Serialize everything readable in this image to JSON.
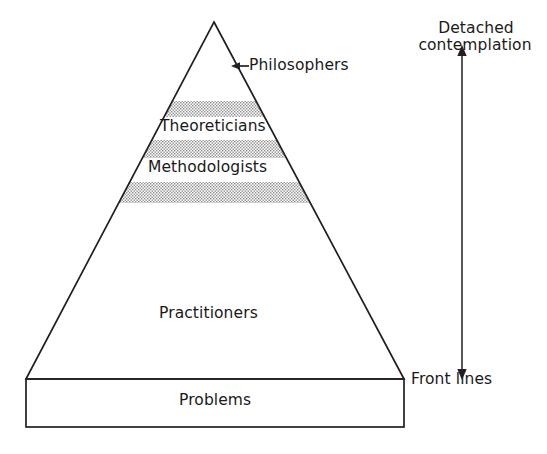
{
  "diagram": {
    "title_visible": false,
    "shape": "pyramid-hierarchy",
    "stroke_color": "#231f20",
    "band_fill": "#b9b9b9",
    "background": "#ffffff",
    "pyramid": {
      "apex": {
        "x": 214,
        "y": 22
      },
      "base_left": {
        "x": 26,
        "y": 379
      },
      "base_right": {
        "x": 404,
        "y": 379
      }
    },
    "layers": [
      {
        "key": "philosophers",
        "label": "Philosophers",
        "shaded": false,
        "callout": true
      },
      {
        "key": "theoreticians",
        "label": "Theoreticians",
        "shaded": true,
        "callout": false
      },
      {
        "key": "methodologists",
        "label": "Methodologists",
        "shaded": true,
        "callout": false
      },
      {
        "key": "practitioners",
        "label": "Practitioners",
        "shaded": false,
        "callout": false
      }
    ],
    "base_box": {
      "label": "Problems",
      "x": 26,
      "y": 379,
      "width": 378,
      "height": 48
    },
    "shaded_bands": [
      {
        "top": 101,
        "bottom": 117
      },
      {
        "top": 140,
        "bottom": 158
      },
      {
        "top": 182,
        "bottom": 203
      }
    ],
    "axis": {
      "shaft_x": 462,
      "top_y": 48,
      "bottom_y": 378,
      "top_label_line1": "Detached",
      "top_label_line2": "contemplation",
      "bottom_label": "Front lines",
      "double_headed": true
    },
    "callout": {
      "label": "Philosophers",
      "arrow_from_x": 248,
      "arrow_to_x": 232,
      "arrow_y": 66
    },
    "icons": {
      "arrow_up_icon": "arrow-up",
      "arrow_down_icon": "arrow-down",
      "arrow_left_icon": "arrow-left"
    }
  }
}
